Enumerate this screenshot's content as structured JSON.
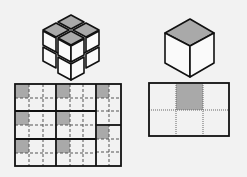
{
  "colors": {
    "background": "#f2f2f2",
    "stroke": "#111111",
    "shade": "#a9a9a9",
    "face": "#fafafa",
    "dash": "#555555"
  },
  "figures": {
    "left_cube": {
      "label": "2x2x2 cube with shaded tops",
      "layers": 2,
      "size": 2
    },
    "right_cube": {
      "label": "single cube with shaded top"
    },
    "left_grid": {
      "label": "net grid for 2x2x2 cube",
      "blocks": [
        {
          "col": 0,
          "row": 0,
          "shaded": "top-left"
        },
        {
          "col": 1,
          "row": 0,
          "shaded": "top-left"
        },
        {
          "col": 0,
          "row": 1,
          "shaded": "top-left"
        },
        {
          "col": 1,
          "row": 1,
          "shaded": "top-left"
        },
        {
          "col": 0,
          "row": 2,
          "shaded": "top-left"
        },
        {
          "col": 1,
          "row": 2,
          "shaded": "top-left"
        },
        {
          "col": 2,
          "row": 0,
          "shaded": "top-left",
          "tall": true
        },
        {
          "col": 2,
          "row": 1,
          "shaded": "top-left",
          "tall": true
        }
      ]
    },
    "right_grid": {
      "label": "3x2 grid with top-middle shaded",
      "cols": 3,
      "rows": 2,
      "shaded_cells": [
        [
          0,
          1
        ]
      ]
    }
  }
}
